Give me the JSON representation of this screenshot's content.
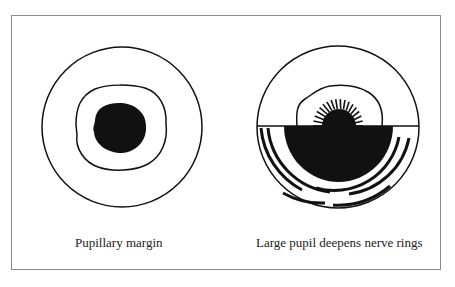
{
  "figure": {
    "panels": [
      {
        "id": "left",
        "caption": "Pupillary margin"
      },
      {
        "id": "right",
        "caption": "Large pupil deepens nerve rings"
      }
    ]
  },
  "colors": {
    "ink": "#111111",
    "frame": "#8a8a8a",
    "background": "#ffffff"
  }
}
